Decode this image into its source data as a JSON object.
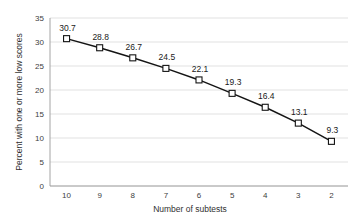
{
  "chart_data": {
    "type": "line",
    "title": "",
    "xlabel": "Number of subtests",
    "ylabel": "Percent with one or more low scores",
    "categories": [
      "10",
      "9",
      "8",
      "7",
      "6",
      "5",
      "4",
      "3",
      "2"
    ],
    "values": [
      30.7,
      28.8,
      26.7,
      24.5,
      22.1,
      19.3,
      16.4,
      13.1,
      9.3
    ],
    "data_labels": [
      "30.7",
      "28.8",
      "26.7",
      "24.5",
      "22.1",
      "19.3",
      "16.4",
      "13.1",
      "9.3"
    ],
    "ylim": [
      0,
      35
    ],
    "ytick_labels": [
      "0",
      "5",
      "10",
      "15",
      "20",
      "25",
      "30",
      "35"
    ],
    "ytick_values": [
      0,
      5,
      10,
      15,
      20,
      25,
      30,
      35
    ],
    "xtick_labels": [
      "10",
      "9",
      "8",
      "7",
      "6",
      "5",
      "4",
      "3",
      "2"
    ],
    "grid": "horizontal",
    "legend": "none",
    "marker": "square-open",
    "series_color": "#141414",
    "marker_fill": "#ffffff",
    "gridline_color": "#d9d9d9",
    "axis_color": "#9a9a9a",
    "background_color": "#ffffff"
  }
}
